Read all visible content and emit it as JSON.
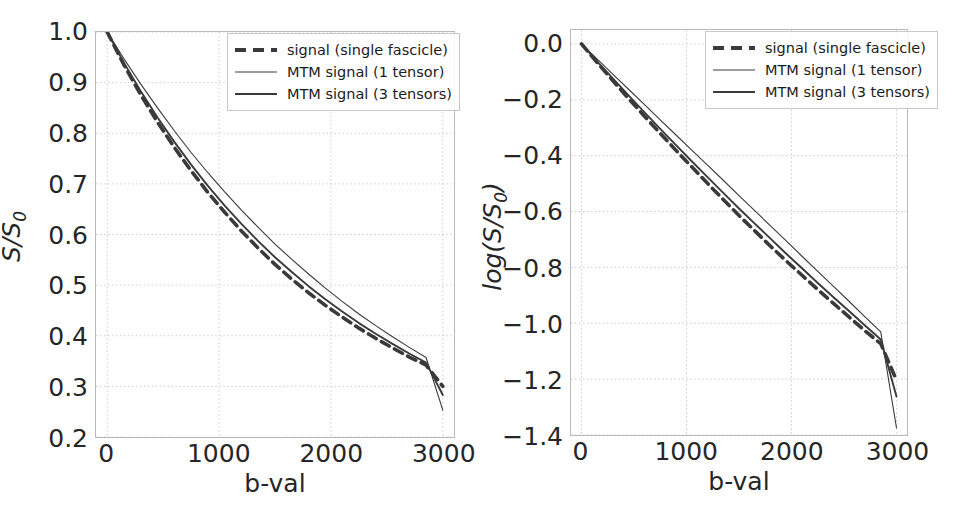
{
  "figure": {
    "background": "#ffffff",
    "line_color": "#3a3a3a",
    "grid_color": "#cccccc",
    "frame_color": "#b9b9b9"
  },
  "legend": {
    "entries": [
      {
        "label": "signal (single fascicle)",
        "style": "dashed",
        "width": 4.0
      },
      {
        "label": "MTM signal (1 tensor)",
        "style": "solid",
        "width": 1.2
      },
      {
        "label": "MTM signal (3 tensors)",
        "style": "solid",
        "width": 2.0
      }
    ]
  },
  "chart_data": [
    {
      "id": "left",
      "type": "line",
      "title": "",
      "xlabel": "b-val",
      "ylabel": "S/S_0",
      "ylabel_base": "S/S",
      "ylabel_sub": "0",
      "xlim": [
        -100,
        3100
      ],
      "ylim": [
        0.2,
        1.0
      ],
      "xticks": [
        0,
        1000,
        2000,
        3000
      ],
      "xticklabels": [
        "0",
        "1000",
        "2000",
        "3000"
      ],
      "yticks": [
        0.2,
        0.3,
        0.4,
        0.5,
        0.6,
        0.7,
        0.8,
        0.9,
        1.0
      ],
      "yticklabels": [
        "0.2",
        "0.3",
        "0.4",
        "0.5",
        "0.6",
        "0.7",
        "0.8",
        "0.9",
        "1.0"
      ],
      "grid": true,
      "legend_position": "upper right",
      "x": [
        0,
        150,
        300,
        450,
        600,
        750,
        900,
        1050,
        1200,
        1350,
        1500,
        1650,
        1800,
        1950,
        2100,
        2250,
        2400,
        2550,
        2700,
        2850,
        3000
      ],
      "series": [
        {
          "name": "signal (single fascicle)",
          "style": "dashed",
          "values": [
            1.0,
            0.935,
            0.876,
            0.822,
            0.772,
            0.726,
            0.683,
            0.644,
            0.607,
            0.573,
            0.541,
            0.512,
            0.485,
            0.46,
            0.437,
            0.415,
            0.395,
            0.376,
            0.358,
            0.342,
            0.3
          ]
        },
        {
          "name": "MTM signal (1 tensor)",
          "style": "solid",
          "values": [
            1.0,
            0.947,
            0.897,
            0.85,
            0.805,
            0.762,
            0.722,
            0.684,
            0.648,
            0.614,
            0.581,
            0.551,
            0.522,
            0.494,
            0.468,
            0.443,
            0.42,
            0.398,
            0.377,
            0.357,
            0.253
          ]
        },
        {
          "name": "MTM signal (3 tensors)",
          "style": "solid",
          "values": [
            1.0,
            0.939,
            0.883,
            0.831,
            0.783,
            0.738,
            0.696,
            0.657,
            0.621,
            0.587,
            0.555,
            0.526,
            0.498,
            0.472,
            0.448,
            0.425,
            0.404,
            0.384,
            0.365,
            0.347,
            0.283
          ]
        }
      ]
    },
    {
      "id": "right",
      "type": "line",
      "title": "",
      "xlabel": "b-val",
      "ylabel": "log(S/S_0)",
      "ylabel_base_pre": "log(S/S",
      "ylabel_sub": "0",
      "ylabel_base_post": ")",
      "xlim": [
        -100,
        3100
      ],
      "ylim": [
        -1.4,
        0.05
      ],
      "xticks": [
        0,
        1000,
        2000,
        3000
      ],
      "xticklabels": [
        "0",
        "1000",
        "2000",
        "3000"
      ],
      "yticks": [
        -1.4,
        -1.2,
        -1.0,
        -0.8,
        -0.6,
        -0.4,
        -0.2,
        0.0
      ],
      "yticklabels": [
        "−1.4",
        "−1.2",
        "−1.0",
        "−0.8",
        "−0.6",
        "−0.4",
        "−0.2",
        "0.0"
      ],
      "grid": true,
      "legend_position": "upper right",
      "x": [
        0,
        150,
        300,
        450,
        600,
        750,
        900,
        1050,
        1200,
        1350,
        1500,
        1650,
        1800,
        1950,
        2100,
        2250,
        2400,
        2550,
        2700,
        2850,
        3000
      ],
      "series": [
        {
          "name": "signal (single fascicle)",
          "style": "dashed",
          "values": [
            0.0,
            -0.067,
            -0.132,
            -0.196,
            -0.259,
            -0.32,
            -0.381,
            -0.44,
            -0.499,
            -0.557,
            -0.614,
            -0.669,
            -0.724,
            -0.777,
            -0.828,
            -0.879,
            -0.929,
            -0.978,
            -1.027,
            -1.073,
            -1.204
          ]
        },
        {
          "name": "MTM signal (1 tensor)",
          "style": "solid",
          "values": [
            0.0,
            -0.054,
            -0.109,
            -0.163,
            -0.217,
            -0.272,
            -0.326,
            -0.38,
            -0.434,
            -0.488,
            -0.543,
            -0.597,
            -0.651,
            -0.705,
            -0.76,
            -0.814,
            -0.868,
            -0.922,
            -0.977,
            -1.031,
            -1.375
          ]
        },
        {
          "name": "MTM signal (3 tensors)",
          "style": "solid",
          "values": [
            0.0,
            -0.063,
            -0.124,
            -0.185,
            -0.245,
            -0.304,
            -0.362,
            -0.42,
            -0.477,
            -0.533,
            -0.589,
            -0.643,
            -0.697,
            -0.751,
            -0.803,
            -0.856,
            -0.907,
            -0.957,
            -1.008,
            -1.058,
            -1.262
          ]
        }
      ]
    }
  ]
}
